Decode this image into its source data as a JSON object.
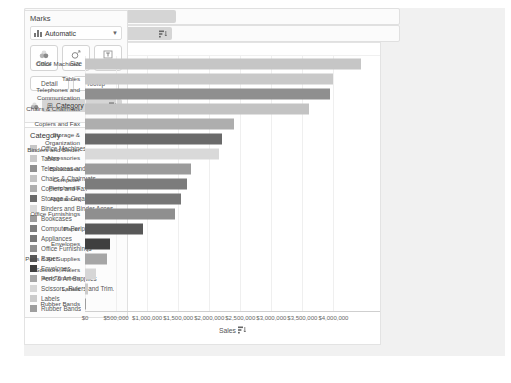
{
  "marks_card": {
    "title": "Marks",
    "mark_type": "Automatic",
    "buttons": {
      "color": "Color",
      "size": "Size",
      "label": "Label",
      "detail": "Detail",
      "tooltip": "Tooltip"
    },
    "color_pill": "Category"
  },
  "shelves": {
    "columns_label": "Columns",
    "columns_pill": "SUM(Sales)",
    "rows_label": "Rows",
    "rows_pill": "Category"
  },
  "legend": {
    "title": "Category",
    "items": [
      {
        "label": "Office Machines",
        "color": "#c6c6c6"
      },
      {
        "label": "Tables",
        "color": "#c9c9c9"
      },
      {
        "label": "Telephones and Commun.",
        "color": "#8f8f8f"
      },
      {
        "label": "Chairs & Chairmats",
        "color": "#c3c3c3"
      },
      {
        "label": "Copiers and Fax",
        "color": "#aeaeae"
      },
      {
        "label": "Storage & Organization",
        "color": "#6a6a6a"
      },
      {
        "label": "Binders and Binder Acces.",
        "color": "#d9d9d9"
      },
      {
        "label": "Bookcases",
        "color": "#9b9b9b"
      },
      {
        "label": "Computer Peripherals",
        "color": "#7c7c7c"
      },
      {
        "label": "Appliances",
        "color": "#767676"
      },
      {
        "label": "Office Furnishings",
        "color": "#8f8f8f"
      },
      {
        "label": "Paper",
        "color": "#585858"
      },
      {
        "label": "Envelopes",
        "color": "#3f3f3f"
      },
      {
        "label": "Pens & Art Supplies",
        "color": "#a6a6a6"
      },
      {
        "label": "Scissors, Rulers and Trim.",
        "color": "#d6d6d6"
      },
      {
        "label": "Labels",
        "color": "#cbcbcb"
      },
      {
        "label": "Rubber Bands",
        "color": "#9e9e9e"
      }
    ]
  },
  "chart_data": {
    "type": "bar",
    "orientation": "horizontal",
    "column_header": "Category",
    "categories": [
      "Office Machines",
      "Tables",
      "Telephones and Communication",
      "Chairs & Chairmats",
      "Copiers and Fax",
      "Storage & Organization",
      "Binders and Binder Accessories",
      "Bookcases",
      "Computer Peripherals",
      "Appliances",
      "Office Furnishings",
      "Paper",
      "Envelopes",
      "Pens & Art Supplies",
      "Scissors, Rulers and Trimmers",
      "Labels",
      "Rubber Bands"
    ],
    "values": [
      4450000,
      4000000,
      3950000,
      3600000,
      2400000,
      2200000,
      2150000,
      1700000,
      1650000,
      1550000,
      1450000,
      930000,
      400000,
      360000,
      170000,
      50000,
      15000
    ],
    "colors": [
      "#c6c6c6",
      "#c9c9c9",
      "#8f8f8f",
      "#c3c3c3",
      "#aeaeae",
      "#6a6a6a",
      "#d9d9d9",
      "#9b9b9b",
      "#7c7c7c",
      "#767676",
      "#8f8f8f",
      "#585858",
      "#3f3f3f",
      "#a6a6a6",
      "#d6d6d6",
      "#cbcbcb",
      "#9e9e9e"
    ],
    "xlabel": "Sales",
    "xlim": [
      0,
      4750000
    ],
    "sort": "descending",
    "grid": "vertical-light",
    "x_ticks": [
      {
        "value": 0,
        "label": "$0"
      },
      {
        "value": 500000,
        "label": "$500,000"
      },
      {
        "value": 1000000,
        "label": "$1,000,000"
      },
      {
        "value": 1500000,
        "label": "$1,500,000"
      },
      {
        "value": 2000000,
        "label": "$2,000,000"
      },
      {
        "value": 2500000,
        "label": "$2,500,000"
      },
      {
        "value": 3000000,
        "label": "$3,000,000"
      },
      {
        "value": 3500000,
        "label": "$3,500,000"
      },
      {
        "value": 4000000,
        "label": "$4,000,000"
      }
    ]
  }
}
